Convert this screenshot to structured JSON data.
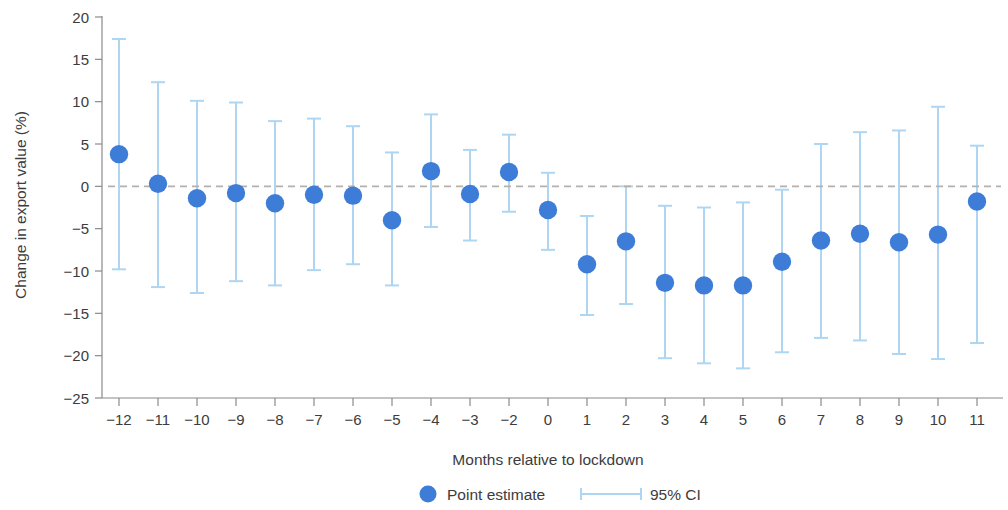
{
  "chart_data": {
    "type": "scatter",
    "title": "",
    "subtitle": "",
    "xlabel": "Months relative to lockdown",
    "ylabel": "Change in export value (%)",
    "xlim": [
      -12.6,
      11.6
    ],
    "ylim": [
      -25,
      20
    ],
    "yticks": [
      20,
      15,
      10,
      5,
      0,
      -5,
      -10,
      -15,
      -20,
      -25
    ],
    "ytick_labels": [
      "20",
      "15",
      "10",
      "5",
      "0",
      "−5",
      "−10",
      "−15",
      "−20",
      "−25"
    ],
    "categories": [
      -12,
      -11,
      -10,
      -9,
      -8,
      -7,
      -6,
      -5,
      -4,
      -3,
      -2,
      0,
      1,
      2,
      3,
      4,
      5,
      6,
      7,
      8,
      9,
      10,
      11
    ],
    "xtick_labels": [
      "−12",
      "−11",
      "−10",
      "−9",
      "−8",
      "−7",
      "−6",
      "−5",
      "−4",
      "−3",
      "−2",
      "0",
      "1",
      "2",
      "3",
      "4",
      "5",
      "6",
      "7",
      "8",
      "9",
      "10",
      "11"
    ],
    "values": [
      3.8,
      0.3,
      -1.4,
      -0.8,
      -2.0,
      -1.0,
      -1.1,
      -4.0,
      1.8,
      -0.9,
      1.7,
      -2.8,
      -9.2,
      -6.5,
      -11.4,
      -11.7,
      -11.7,
      -8.9,
      -6.4,
      -5.6,
      -6.6,
      -5.7,
      -1.8
    ],
    "ci_low": [
      -9.8,
      -11.9,
      -12.6,
      -11.2,
      -11.7,
      -9.9,
      -9.2,
      -11.7,
      -4.8,
      -6.4,
      -3.0,
      -7.5,
      -15.2,
      -13.9,
      -20.3,
      -20.9,
      -21.5,
      -19.6,
      -17.9,
      -18.2,
      -19.8,
      -20.4,
      -18.5
    ],
    "ci_high": [
      17.4,
      12.3,
      10.1,
      9.9,
      7.7,
      8.0,
      7.1,
      4.0,
      8.5,
      4.3,
      6.1,
      1.6,
      -3.5,
      0.0,
      -2.3,
      -2.5,
      -1.9,
      -0.4,
      5.0,
      6.4,
      6.6,
      9.4,
      4.8
    ],
    "reference_line": 0,
    "grid": false,
    "legend_position": "bottom",
    "colors": {
      "point": "#3d7dd8",
      "ci": "#aed6f2",
      "reference_line": "#b5b0ab",
      "axis": "#8a8a8a",
      "text": "#3c3c3c"
    }
  },
  "legend": {
    "point_label": "Point estimate",
    "ci_label": "95% CI"
  }
}
